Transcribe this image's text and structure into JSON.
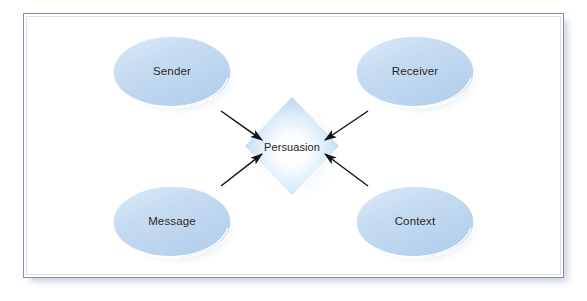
{
  "figure": {
    "name": "persuasion-model",
    "title": "Persuasion",
    "frame": {
      "border_color": "#8590b0",
      "background_color": "#ffffff",
      "shadow_color": "#78829b"
    }
  },
  "diagram": {
    "type": "hub-and-spoke",
    "center": {
      "id": "persuasion",
      "label": "Persuasion",
      "shape": "diamond",
      "fill_center": "#ffffff",
      "fill_edge": "#b6d4ef",
      "cx": 268,
      "cy": 132,
      "half_width": 48,
      "half_height": 50
    },
    "nodes": [
      {
        "id": "sender",
        "label": "Sender",
        "shape": "ellipse",
        "position": "top-left",
        "cx": 148,
        "cy": 58,
        "rx": 59,
        "ry": 36,
        "fill": "#c0d7f0"
      },
      {
        "id": "receiver",
        "label": "Receiver",
        "shape": "ellipse",
        "position": "top-right",
        "cx": 391,
        "cy": 58,
        "rx": 59,
        "ry": 36,
        "fill": "#c0d7f0"
      },
      {
        "id": "message",
        "label": "Message",
        "shape": "ellipse",
        "position": "bottom-left",
        "cx": 148,
        "cy": 208,
        "rx": 59,
        "ry": 36,
        "fill": "#c0d7f0"
      },
      {
        "id": "context",
        "label": "Context",
        "shape": "ellipse",
        "position": "bottom-right",
        "cx": 391,
        "cy": 208,
        "rx": 59,
        "ry": 36,
        "fill": "#c0d7f0"
      }
    ],
    "arrows": [
      {
        "id": "sender-to-persuasion",
        "from": "sender",
        "to": "persuasion",
        "direction": "down-right",
        "color": "#151515"
      },
      {
        "id": "receiver-to-persuasion",
        "from": "receiver",
        "to": "persuasion",
        "direction": "down-left",
        "color": "#151515"
      },
      {
        "id": "message-to-persuasion",
        "from": "message",
        "to": "persuasion",
        "direction": "up-right",
        "color": "#151515"
      },
      {
        "id": "context-to-persuasion",
        "from": "context",
        "to": "persuasion",
        "direction": "up-left",
        "color": "#151515"
      }
    ],
    "palette": {
      "node_fill": "#c0d7f0",
      "node_fill_light": "#dcebfa",
      "node_rim": "#ffffff",
      "node_shadow": "#a8c2dd",
      "diamond_edge": "#b6d4ef",
      "arrow": "#151515",
      "text": "#1d1d22"
    }
  }
}
